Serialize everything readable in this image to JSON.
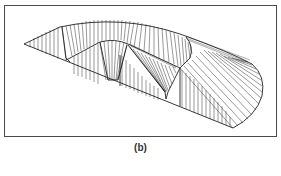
{
  "figure": {
    "caption": "(b)",
    "colors": {
      "ink": "#333333",
      "frame": "#4a4a4a",
      "background": "#ffffff"
    }
  }
}
